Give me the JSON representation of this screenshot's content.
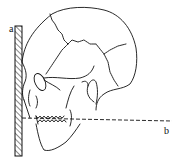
{
  "diagram": {
    "labels": {
      "a": "a",
      "b": "b"
    },
    "elements": {
      "board": "hatched-vertical-board",
      "skull": "skull-lateral-view",
      "reference_line": "dashed-horizontal-line"
    },
    "colors": {
      "stroke": "#111111",
      "background": "#ffffff"
    }
  }
}
